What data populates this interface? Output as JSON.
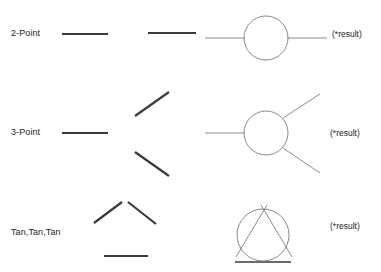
{
  "figure": {
    "background_color": "#ffffff",
    "ink_color": "#1c1c1c",
    "thick_stroke_color": "#3a3a3a",
    "thin_stroke_color": "#8a8a8a",
    "width": 381,
    "height": 272
  },
  "rows": [
    {
      "id": "two-point",
      "label": "2-Point",
      "result_label": "(*result)",
      "inputs": {
        "type": "two-horizontal-segments",
        "segments": [
          {
            "x1": 62,
            "y1": 34,
            "x2": 108,
            "y2": 34
          },
          {
            "x1": 148,
            "y1": 33,
            "x2": 196,
            "y2": 33
          }
        ]
      },
      "result": {
        "type": "circle-with-two-tangent-lines",
        "circle": {
          "cx": 266,
          "cy": 38,
          "r": 22
        },
        "lines": [
          {
            "x1": 205,
            "y1": 38,
            "x2": 244,
            "y2": 38
          },
          {
            "x1": 288,
            "y1": 38,
            "x2": 327,
            "y2": 38
          }
        ]
      }
    },
    {
      "id": "three-point",
      "label": "3-Point",
      "result_label": "(*result)",
      "inputs": {
        "type": "three-fanned-segments",
        "segments": [
          {
            "x1": 62,
            "y1": 133,
            "x2": 108,
            "y2": 133
          },
          {
            "x1": 135,
            "y1": 116,
            "x2": 169,
            "y2": 92
          },
          {
            "x1": 135,
            "y1": 152,
            "x2": 169,
            "y2": 176
          }
        ]
      },
      "result": {
        "type": "circle-with-three-tangent-lines",
        "circle": {
          "cx": 266,
          "cy": 133,
          "r": 22
        },
        "lines": [
          {
            "x1": 205,
            "y1": 133,
            "x2": 244,
            "y2": 133
          },
          {
            "x1": 284,
            "y1": 117,
            "x2": 320,
            "y2": 94
          },
          {
            "x1": 284,
            "y1": 149,
            "x2": 320,
            "y2": 173
          }
        ]
      }
    },
    {
      "id": "tan-tan-tan",
      "label": "Tan,Tan,Tan",
      "result_label": "(*result)",
      "inputs": {
        "type": "triangle-of-three-segments",
        "segments": [
          {
            "x1": 94,
            "y1": 222,
            "x2": 122,
            "y2": 202
          },
          {
            "x1": 127,
            "y1": 202,
            "x2": 155,
            "y2": 223
          },
          {
            "x1": 104,
            "y1": 256,
            "x2": 148,
            "y2": 256
          }
        ]
      },
      "result": {
        "type": "circle-inscribed-in-triangle",
        "circle": {
          "cx": 263,
          "cy": 235,
          "r": 26
        },
        "lines": [
          {
            "x1": 236,
            "y1": 256,
            "x2": 266,
            "y2": 205
          },
          {
            "x1": 262,
            "y1": 205,
            "x2": 292,
            "y2": 256
          },
          {
            "x1": 235,
            "y1": 262,
            "x2": 291,
            "y2": 262
          }
        ]
      }
    }
  ]
}
